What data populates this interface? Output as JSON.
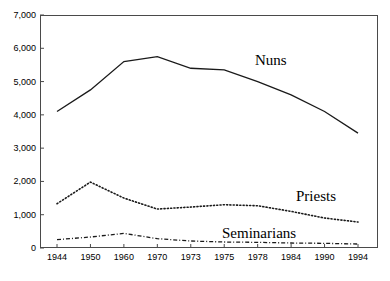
{
  "chart_data": {
    "type": "line",
    "title": "",
    "xlabel": "",
    "ylabel": "",
    "ylim": [
      0,
      7000
    ],
    "ytick_labels": [
      "7,000",
      "6,000",
      "5,000",
      "4,000",
      "3,000",
      "2,000",
      "1,000",
      "0"
    ],
    "ytick_values": [
      7000,
      6000,
      5000,
      4000,
      3000,
      2000,
      1000,
      0
    ],
    "categories": [
      "1944",
      "1950",
      "1960",
      "1970",
      "1973",
      "1975",
      "1978",
      "1984",
      "1990",
      "1994"
    ],
    "grid": false,
    "legend_position": "inline-annotations",
    "series": [
      {
        "name": "Nuns",
        "style": "solid",
        "values": [
          4100,
          4750,
          5600,
          5750,
          5400,
          5350,
          5000,
          4600,
          4100,
          3450
        ]
      },
      {
        "name": "Priests",
        "style": "dotted",
        "values": [
          1330,
          1980,
          1500,
          1170,
          1230,
          1300,
          1270,
          1100,
          900,
          780
        ]
      },
      {
        "name": "Seminarians",
        "style": "dash-dot",
        "values": [
          250,
          330,
          440,
          280,
          210,
          180,
          170,
          150,
          140,
          120
        ]
      }
    ],
    "annotations": [
      {
        "text": "Nuns",
        "series": "Nuns"
      },
      {
        "text": "Priests",
        "series": "Priests"
      },
      {
        "text": "Seminarians",
        "series": "Seminarians"
      }
    ],
    "colors": {
      "line": "#1a1a1a",
      "frame": "#4a4a4a",
      "background": "#ffffff",
      "text": "#000000"
    }
  }
}
